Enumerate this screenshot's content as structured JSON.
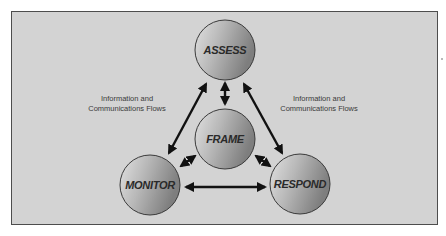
{
  "diagram": {
    "type": "cycle-diagram",
    "colors": {
      "panel_background": "#d3d3d3",
      "panel_border": "#4d4d4d",
      "node_gradient_light": "#e2e2e2",
      "node_gradient_dark": "#7e7e7e",
      "node_outline": "#3a3a3a",
      "arrow": "#111111",
      "text": "#2a2a2a"
    },
    "nodes": [
      {
        "id": "assess",
        "label": "ASSESS",
        "cx": 225,
        "cy": 50,
        "r": 30
      },
      {
        "id": "frame",
        "label": "FRAME",
        "cx": 225,
        "cy": 139,
        "r": 30
      },
      {
        "id": "monitor",
        "label": "MONITOR",
        "cx": 150,
        "cy": 185,
        "r": 30
      },
      {
        "id": "respond",
        "label": "RESPOND",
        "cx": 300,
        "cy": 184,
        "r": 30
      }
    ],
    "edges": [
      {
        "from": "assess",
        "to": "monitor",
        "direction": "bidirectional",
        "x1": 206,
        "y1": 84,
        "x2": 169,
        "y2": 153
      },
      {
        "from": "assess",
        "to": "respond",
        "direction": "bidirectional",
        "x1": 244,
        "y1": 84,
        "x2": 282,
        "y2": 153
      },
      {
        "from": "assess",
        "to": "frame",
        "direction": "bidirectional",
        "x1": 225,
        "y1": 83,
        "x2": 225,
        "y2": 104
      },
      {
        "from": "frame",
        "to": "monitor",
        "direction": "bidirectional",
        "x1": 195,
        "y1": 156,
        "x2": 181,
        "y2": 166
      },
      {
        "from": "frame",
        "to": "respond",
        "direction": "bidirectional",
        "x1": 256,
        "y1": 156,
        "x2": 270,
        "y2": 166
      },
      {
        "from": "monitor",
        "to": "respond",
        "direction": "bidirectional",
        "x1": 186,
        "y1": 187,
        "x2": 265,
        "y2": 187
      }
    ],
    "annotations": [
      {
        "id": "flow-left",
        "line1": "Information and",
        "line2": "Communications Flows"
      },
      {
        "id": "flow-right",
        "line1": "Information and",
        "line2": "Communications Flows"
      }
    ]
  }
}
